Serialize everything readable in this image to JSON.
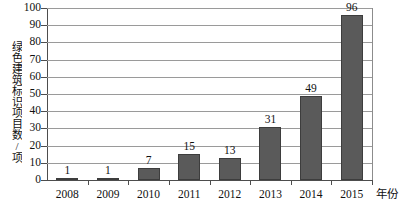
{
  "chart_data": {
    "type": "bar",
    "title": "",
    "subtitle": "",
    "xlabel": "年份",
    "ylabel": "绿色建筑标识项目数/项",
    "categories": [
      "2008",
      "2009",
      "2010",
      "2011",
      "2012",
      "2013",
      "2014",
      "2015"
    ],
    "values": [
      1,
      1,
      7,
      15,
      13,
      31,
      49,
      96
    ],
    "data_labels": [
      "1",
      "1",
      "7",
      "15",
      "13",
      "31",
      "49",
      "96"
    ],
    "ylim": [
      0,
      100
    ],
    "yticks": [
      0,
      10,
      20,
      30,
      40,
      50,
      60,
      70,
      80,
      90,
      100
    ],
    "ytick_labels": [
      "0",
      "10",
      "20",
      "30",
      "40",
      "50",
      "60",
      "70",
      "80",
      "90",
      "100"
    ],
    "grid": true,
    "grid_axis": "y",
    "legend": false,
    "legend_position": "none",
    "series": [
      {
        "name": "绿色建筑标识项目数",
        "values": [
          1,
          1,
          7,
          15,
          13,
          31,
          49,
          96
        ]
      }
    ],
    "colors": {
      "bar_fill": "#5a5a5a",
      "bar_border": "#3d3d3d",
      "gridline": "#9a9a9a",
      "axis": "#4d4d4d",
      "text": "#111111",
      "background": "#ffffff"
    }
  }
}
